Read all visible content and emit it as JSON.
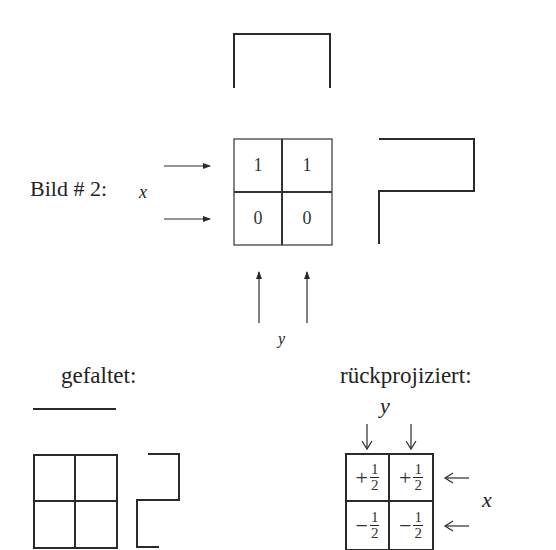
{
  "figure": {
    "title_label": "Bild # 2:",
    "x_axis_label": "x",
    "y_axis_label": "y",
    "original_grid": {
      "values": [
        [
          "1",
          "1"
        ],
        [
          "0",
          "0"
        ]
      ]
    },
    "folded": {
      "label": "gefaltet:"
    },
    "backprojected": {
      "label": "rückprojiziert:",
      "y_label": "y",
      "x_label": "x",
      "cells": [
        {
          "sign": "+",
          "num": "1",
          "den": "2"
        },
        {
          "sign": "+",
          "num": "1",
          "den": "2"
        },
        {
          "sign": "−",
          "num": "1",
          "den": "2"
        },
        {
          "sign": "−",
          "num": "1",
          "den": "2"
        }
      ]
    },
    "line_color": "#2a2a2a"
  }
}
